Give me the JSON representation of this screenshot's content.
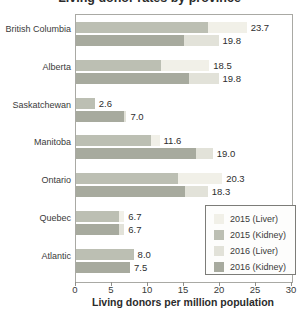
{
  "title": "Living donor rates by province",
  "chart_data": {
    "type": "bar",
    "orientation": "horizontal",
    "title": "Living donor rates by province",
    "xlabel": "Living donors per million population",
    "xlim": [
      0,
      30
    ],
    "xticks": [
      0,
      5,
      10,
      15,
      20,
      25,
      30
    ],
    "grid": false,
    "legend_position": "inside-bottom-right",
    "legend": [
      {
        "label": "2015 (Liver)",
        "color_key": "liver_2015"
      },
      {
        "label": "2015 (Kidney)",
        "color_key": "kidney_2015"
      },
      {
        "label": "2016 (Liver)",
        "color_key": "liver_2016"
      },
      {
        "label": "2016 (Kidney)",
        "color_key": "kidney_2016"
      }
    ],
    "colors": {
      "liver_2015": "#f1f0e8",
      "kidney_2015": "#bcbfb3",
      "liver_2016": "#e2e2d9",
      "kidney_2016": "#a7aa9e",
      "axis": "#a9a9a4"
    },
    "categories": [
      "British Columbia",
      "Alberta",
      "Saskatchewan",
      "Manitoba",
      "Ontario",
      "Quebec",
      "Atlantic"
    ],
    "rows": [
      {
        "province": "British Columbia",
        "bars": [
          {
            "year": "2015",
            "kidney": 18.4,
            "liver": 5.3,
            "total": 23.7,
            "total_label": "23.7"
          },
          {
            "year": "2016",
            "kidney": 15.0,
            "liver": 4.8,
            "total": 19.8,
            "total_label": "19.8"
          }
        ]
      },
      {
        "province": "Alberta",
        "bars": [
          {
            "year": "2015",
            "kidney": 11.8,
            "liver": 6.7,
            "total": 18.5,
            "total_label": "18.5"
          },
          {
            "year": "2016",
            "kidney": 15.7,
            "liver": 4.1,
            "total": 19.8,
            "total_label": "19.8"
          }
        ]
      },
      {
        "province": "Saskatchewan",
        "bars": [
          {
            "year": "2015",
            "kidney": 2.6,
            "liver": 0.0,
            "total": 2.6,
            "total_label": "2.6"
          },
          {
            "year": "2016",
            "kidney": 6.6,
            "liver": 0.4,
            "total": 7.0,
            "total_label": "7.0"
          }
        ]
      },
      {
        "province": "Manitoba",
        "bars": [
          {
            "year": "2015",
            "kidney": 10.4,
            "liver": 1.2,
            "total": 11.6,
            "total_label": "11.6"
          },
          {
            "year": "2016",
            "kidney": 16.7,
            "liver": 2.3,
            "total": 19.0,
            "total_label": "19.0"
          }
        ]
      },
      {
        "province": "Ontario",
        "bars": [
          {
            "year": "2015",
            "kidney": 14.2,
            "liver": 6.1,
            "total": 20.3,
            "total_label": "20.3"
          },
          {
            "year": "2016",
            "kidney": 15.2,
            "liver": 3.1,
            "total": 18.3,
            "total_label": "18.3"
          }
        ]
      },
      {
        "province": "Quebec",
        "bars": [
          {
            "year": "2015",
            "kidney": 6.0,
            "liver": 0.7,
            "total": 6.7,
            "total_label": "6.7"
          },
          {
            "year": "2016",
            "kidney": 6.0,
            "liver": 0.7,
            "total": 6.7,
            "total_label": "6.7"
          }
        ]
      },
      {
        "province": "Atlantic",
        "bars": [
          {
            "year": "2015",
            "kidney": 8.0,
            "liver": 0.0,
            "total": 8.0,
            "total_label": "8.0"
          },
          {
            "year": "2016",
            "kidney": 7.5,
            "liver": 0.0,
            "total": 7.5,
            "total_label": "7.5"
          }
        ]
      }
    ]
  }
}
